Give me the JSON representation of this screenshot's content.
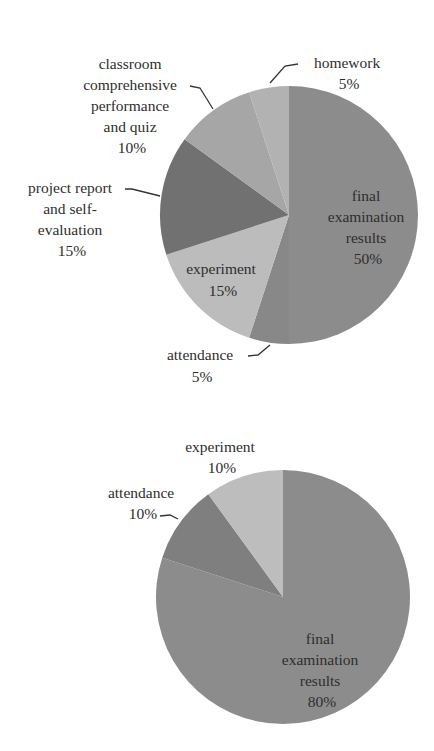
{
  "chart_data": [
    {
      "type": "pie",
      "title": "",
      "start_angle": "12 o'clock, clockwise",
      "slices": [
        {
          "label": "final examination results",
          "value": 50,
          "pct_text": "50%",
          "color": "#8c8c8c"
        },
        {
          "label": "attendance",
          "value": 5,
          "pct_text": "5%",
          "color": "#888888"
        },
        {
          "label": "experiment",
          "value": 15,
          "pct_text": "15%",
          "color": "#bcbcbc"
        },
        {
          "label": "project report and self-evaluation",
          "value": 15,
          "pct_text": "15%",
          "color": "#717171"
        },
        {
          "label": "classroom comprehensive performance and quiz",
          "value": 10,
          "pct_text": "10%",
          "color": "#a6a6a6"
        },
        {
          "label": "homework",
          "value": 5,
          "pct_text": "5%",
          "color": "#b2b2b2"
        }
      ]
    },
    {
      "type": "pie",
      "title": "",
      "start_angle": "12 o'clock, clockwise",
      "slices": [
        {
          "label": "final examination results",
          "value": 80,
          "pct_text": "80%",
          "color": "#8c8c8c"
        },
        {
          "label": "attendance",
          "value": 10,
          "pct_text": "10%",
          "color": "#7f7f7f"
        },
        {
          "label": "experiment",
          "value": 10,
          "pct_text": "10%",
          "color": "#bdbdbd"
        }
      ]
    }
  ],
  "labels": {
    "chart1": {
      "final": [
        "final",
        "examination",
        "results",
        "50%"
      ],
      "attendance": [
        "attendance",
        "5%"
      ],
      "experiment": [
        "experiment",
        "15%"
      ],
      "project": [
        "project report",
        "and self-",
        "evaluation",
        "15%"
      ],
      "classroom": [
        "classroom",
        "comprehensive",
        "performance",
        "and quiz",
        "10%"
      ],
      "homework": [
        "homework",
        "5%"
      ]
    },
    "chart2": {
      "final": [
        "final",
        "examination",
        "results",
        "80%"
      ],
      "attendance": [
        "attendance",
        "10%"
      ],
      "experiment": [
        "experiment",
        "10%"
      ]
    }
  }
}
